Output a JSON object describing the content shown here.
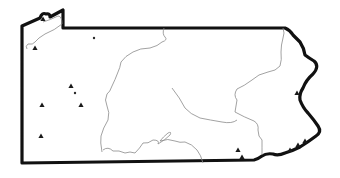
{
  "map": {
    "region": "Pennsylvania",
    "style": "black-and-white outline map",
    "colors": {
      "background": "#ffffff",
      "border": "#111111",
      "rivers": "#8a8a8a",
      "markers": "#1a1a1a"
    },
    "markers": [
      {
        "type": "triangle",
        "x": 43,
        "y": 19
      },
      {
        "type": "triangle",
        "x": 35,
        "y": 48
      },
      {
        "type": "dot",
        "x": 94,
        "y": 38
      },
      {
        "type": "triangle",
        "x": 71,
        "y": 86
      },
      {
        "type": "dot",
        "x": 75,
        "y": 93
      },
      {
        "type": "triangle",
        "x": 42,
        "y": 105
      },
      {
        "type": "triangle",
        "x": 81,
        "y": 105
      },
      {
        "type": "triangle",
        "x": 41,
        "y": 136
      },
      {
        "type": "triangle",
        "x": 297,
        "y": 93
      },
      {
        "type": "triangle",
        "x": 238,
        "y": 150
      },
      {
        "type": "triangle",
        "x": 242,
        "y": 157
      },
      {
        "type": "triangle",
        "x": 290,
        "y": 150
      },
      {
        "type": "triangle",
        "x": 298,
        "y": 145
      },
      {
        "type": "triangle",
        "x": 305,
        "y": 141
      }
    ]
  }
}
